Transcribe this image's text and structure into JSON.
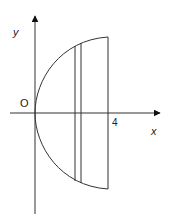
{
  "diagram": {
    "type": "coordinate-sketch",
    "labels": {
      "y_axis": "y",
      "x_axis": "x",
      "origin": "O",
      "x_tick": "4"
    },
    "colors": {
      "stroke": "#333333",
      "background": "#ffffff"
    }
  }
}
